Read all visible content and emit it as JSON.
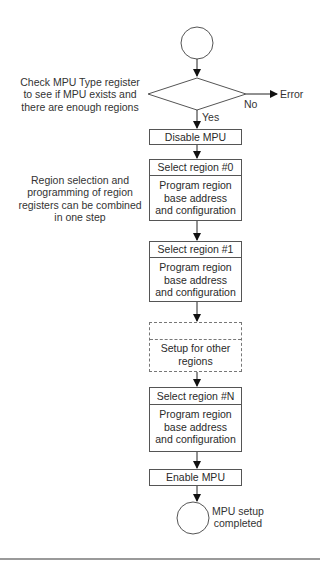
{
  "diagram": {
    "start": {
      "label": ""
    },
    "decision": {
      "annotation": [
        "Check MPU Type register",
        "to see if MPU exists and",
        "there are enough regions"
      ],
      "no_label": "No",
      "yes_label": "Yes",
      "error_label": "Error"
    },
    "steps": {
      "disable": "Disable MPU",
      "region0": {
        "head": "Select region #0",
        "body": [
          "Program region",
          "base address",
          "and configuration"
        ]
      },
      "region1": {
        "head": "Select region #1",
        "body": [
          "Program region",
          "base address",
          "and configuration"
        ]
      },
      "other": {
        "head": "",
        "body": [
          "Setup for other",
          "regions"
        ]
      },
      "regionN": {
        "head": "Select region #N",
        "body": [
          "Program region",
          "base address",
          "and configuration"
        ]
      },
      "enable": "Enable MPU"
    },
    "side_note": [
      "Region selection and",
      "programming of region",
      "registers can be combined",
      "in one step"
    ],
    "end": {
      "label": [
        "MPU setup",
        "completed"
      ]
    }
  }
}
